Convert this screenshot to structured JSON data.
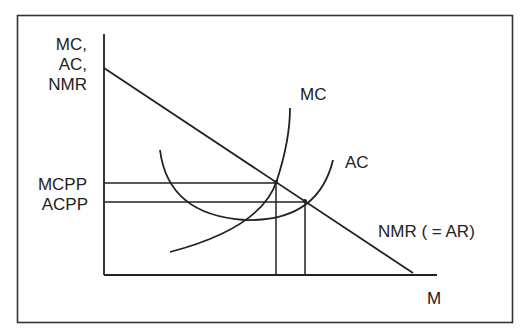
{
  "diagram": {
    "type": "economics-cost-revenue",
    "y_axis_label_lines": [
      "MC,",
      "AC,",
      "NMR"
    ],
    "x_axis_label": "M",
    "levels": [
      {
        "id": "mcpp",
        "label": "MCPP"
      },
      {
        "id": "acpp",
        "label": "ACPP"
      }
    ],
    "curves": [
      {
        "id": "mc",
        "label": "MC",
        "shape": "upward-sloping marginal cost curve"
      },
      {
        "id": "ac",
        "label": "AC",
        "shape": "U-shaped average cost curve"
      },
      {
        "id": "nmr",
        "label": "NMR ( = AR)",
        "shape": "downward-sloping straight line"
      }
    ],
    "intersections": [
      {
        "curves": [
          "MC",
          "NMR"
        ],
        "level": "MCPP"
      },
      {
        "curves": [
          "AC",
          "NMR"
        ],
        "level": "ACPP"
      }
    ],
    "colors": {
      "line": "#222222",
      "background": "#ffffff"
    }
  }
}
